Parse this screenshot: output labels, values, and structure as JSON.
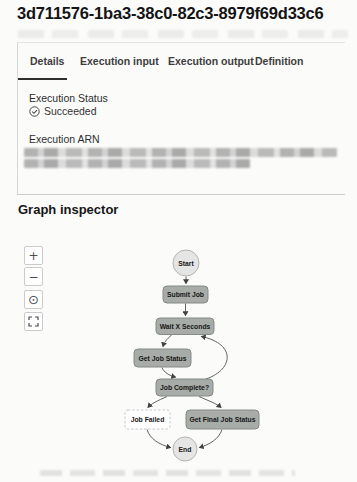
{
  "title": "3d711576-1ba3-38c0-82c3-8979f69d33c6",
  "tabs": [
    {
      "label": "Details",
      "active": true
    },
    {
      "label": "Execution input",
      "active": false
    },
    {
      "label": "Execution output",
      "active": false
    },
    {
      "label": "Definition",
      "active": false
    }
  ],
  "details": {
    "execution_status_label": "Execution Status",
    "execution_status_value": "Succeeded",
    "execution_status_icon": "check-circle",
    "execution_arn_label": "Execution ARN",
    "execution_arn_redacted": true
  },
  "graph_inspector": {
    "heading": "Graph inspector",
    "controls": [
      {
        "name": "zoom-in",
        "glyph": "+"
      },
      {
        "name": "zoom-out",
        "glyph": "−"
      },
      {
        "name": "center",
        "glyph": "⊙"
      },
      {
        "name": "fit-view",
        "glyph": "⛶"
      }
    ],
    "nodes": {
      "start": "Start",
      "submit_job": "Submit Job",
      "wait_x_seconds": "Wait X Seconds",
      "get_job_status": "Get Job Status",
      "job_complete": "Job Complete?",
      "job_failed": "Job Failed",
      "get_final_job_status": "Get Final Job Status",
      "end": "End"
    },
    "edges": [
      {
        "from": "Start",
        "to": "Submit Job"
      },
      {
        "from": "Submit Job",
        "to": "Wait X Seconds"
      },
      {
        "from": "Wait X Seconds",
        "to": "Get Job Status"
      },
      {
        "from": "Get Job Status",
        "to": "Job Complete?"
      },
      {
        "from": "Job Complete?",
        "to": "Wait X Seconds"
      },
      {
        "from": "Job Complete?",
        "to": "Job Failed"
      },
      {
        "from": "Job Complete?",
        "to": "Get Final Job Status"
      },
      {
        "from": "Job Failed",
        "to": "End"
      },
      {
        "from": "Get Final Job Status",
        "to": "End"
      }
    ]
  },
  "colors": {
    "executed_node_fill": "#a7aca8",
    "executed_node_border": "#848a86",
    "unexecuted_node_fill": "#ffffff",
    "unexecuted_node_border": "#c8c8c8",
    "terminal_node_fill": "#e4e5e4",
    "terminal_node_border": "#b4b6b4",
    "edge": "#5f6360",
    "active_tab_underline": "#2f2f2f"
  }
}
